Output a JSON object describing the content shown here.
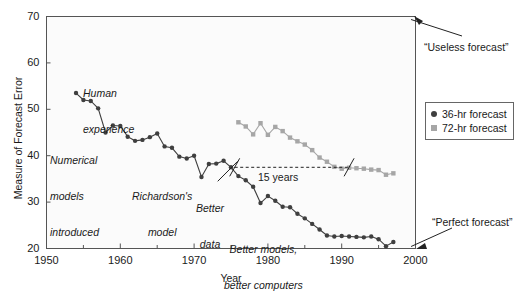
{
  "chart_data": {
    "type": "line",
    "title": "",
    "xlabel": "Year",
    "ylabel": "Measure of Forecast Error",
    "xlim": [
      1950,
      2000
    ],
    "ylim": [
      20,
      70
    ],
    "xticks": [
      1950,
      1960,
      1970,
      1980,
      1990,
      2000
    ],
    "xtick_labels": [
      "1950",
      "1960",
      "1970",
      "1980",
      "1990",
      "2000"
    ],
    "xminorticks": [
      1955,
      1965,
      1975,
      1985,
      1995
    ],
    "yticks": [
      20,
      30,
      40,
      50,
      60,
      70
    ],
    "ytick_labels": [
      "20",
      "30",
      "40",
      "50",
      "60",
      "70"
    ],
    "grid": false,
    "legend_position": "outside-right",
    "series": [
      {
        "name": "36-hr forecast",
        "marker": "circle",
        "color": "#3f3f3f",
        "x": [
          1954,
          1955,
          1956,
          1957,
          1958,
          1959,
          1960,
          1961,
          1962,
          1963,
          1964,
          1965,
          1966,
          1967,
          1968,
          1969,
          1970,
          1971,
          1972,
          1973,
          1974,
          1975,
          1976,
          1977,
          1978,
          1979,
          1980,
          1981,
          1982,
          1983,
          1984,
          1985,
          1986,
          1987,
          1988,
          1989,
          1990,
          1991,
          1992,
          1993,
          1994,
          1995,
          1996,
          1997
        ],
        "y": [
          53.5,
          52.0,
          51.8,
          50.2,
          45.0,
          46.5,
          46.4,
          44.1,
          43.2,
          43.4,
          44.0,
          44.8,
          42.0,
          41.7,
          39.8,
          39.4,
          40.0,
          35.4,
          38.2,
          38.3,
          38.9,
          37.5,
          35.6,
          34.7,
          33.3,
          29.8,
          31.3,
          30.3,
          29.0,
          28.9,
          27.5,
          26.5,
          25.3,
          24.1,
          22.8,
          22.6,
          22.7,
          22.6,
          22.5,
          22.4,
          22.6,
          22.0,
          20.5,
          21.4
        ]
      },
      {
        "name": "72-hr forecast",
        "marker": "square",
        "color": "#a6a6a6",
        "x": [
          1976,
          1977,
          1978,
          1979,
          1980,
          1981,
          1982,
          1983,
          1984,
          1985,
          1986,
          1987,
          1988,
          1989,
          1990,
          1991,
          1992,
          1993,
          1994,
          1995,
          1996,
          1997
        ],
        "y": [
          47.2,
          46.3,
          44.6,
          47.0,
          44.5,
          46.2,
          45.3,
          43.9,
          43.1,
          42.4,
          41.2,
          39.6,
          38.7,
          37.6,
          37.2,
          37.4,
          37.3,
          37.2,
          37.0,
          36.9,
          35.9,
          36.2
        ]
      }
    ],
    "annotations": [
      {
        "name": "human-experience",
        "text_lines": [
          "Human",
          "experience"
        ],
        "style": "italic"
      },
      {
        "name": "numerical-models-introduced",
        "text_lines": [
          "Numerical",
          "models",
          "introduced"
        ],
        "style": "italic"
      },
      {
        "name": "richardsons-model",
        "text_lines": [
          "Richardson's",
          "model"
        ],
        "style": "italic"
      },
      {
        "name": "better-data",
        "text_lines": [
          "Better",
          "data"
        ],
        "style": "italic"
      },
      {
        "name": "better-models-better-computers",
        "text_lines": [
          "Better models,",
          "better computers"
        ],
        "style": "italic"
      },
      {
        "name": "fifteen-years",
        "text_lines": [
          "15 years"
        ],
        "style": "normal"
      },
      {
        "name": "useless-forecast",
        "text_lines": [
          "“Useless forecast”"
        ],
        "style": "normal"
      },
      {
        "name": "perfect-forecast",
        "text_lines": [
          "“Perfect forecast”"
        ],
        "style": "normal"
      }
    ]
  },
  "axis": {
    "ylabel": "Measure of Forecast Error",
    "xlabel": "Year",
    "yticks": [
      "70",
      "60",
      "50",
      "40",
      "30",
      "20"
    ],
    "xticks": [
      "1950",
      "1960",
      "1970",
      "1980",
      "1990",
      "2000"
    ]
  },
  "legend": {
    "items": [
      {
        "label": "36-hr forecast",
        "marker": "circle",
        "color": "#3f3f3f"
      },
      {
        "label": "72-hr forecast",
        "marker": "square",
        "color": "#a6a6a6"
      }
    ]
  },
  "annotations": {
    "human_experience_1": "Human",
    "human_experience_2": "experience",
    "numerical_1": "Numerical",
    "numerical_2": "models",
    "numerical_3": "introduced",
    "richardson_1": "Richardson's",
    "richardson_2": "model",
    "better_data_1": "Better",
    "better_data_2": "data",
    "better_models_1": "Better models,",
    "better_models_2": "better computers",
    "fifteen_years": "15 years",
    "useless_forecast": "“Useless forecast”",
    "perfect_forecast": "“Perfect forecast”"
  },
  "colors": {
    "series36": "#3f3f3f",
    "series72": "#a6a6a6",
    "frame": "#555555",
    "text": "#1a1a1a"
  }
}
